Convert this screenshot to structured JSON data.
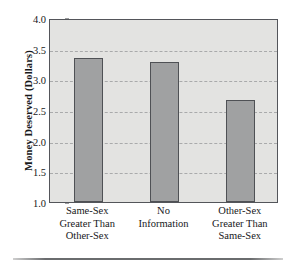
{
  "chart_data": {
    "type": "bar",
    "title": "",
    "xlabel": "",
    "ylabel": "Money Deserved (Dollars)",
    "categories": [
      "Same-Sex Greater Than Other-Sex",
      "No Information",
      "Other-Sex Greater Than Same-Sex"
    ],
    "category_lines": [
      [
        "Same-Sex",
        "Greater Than",
        "Other-Sex"
      ],
      [
        "No",
        "Information"
      ],
      [
        "Other-Sex",
        "Greater Than",
        "Same-Sex"
      ]
    ],
    "values": [
      3.35,
      3.28,
      2.66
    ],
    "ylim": [
      1.0,
      4.0
    ],
    "ytick_labels": [
      "4.0",
      "3.5",
      "3.0",
      "2.5",
      "2.0",
      "1.5",
      "1.0"
    ],
    "ytick_values": [
      4.0,
      3.5,
      3.0,
      2.5,
      2.0,
      1.5,
      1.0
    ],
    "gridlines": [
      3.5,
      3.0,
      2.5,
      2.0,
      1.5
    ],
    "grid": true,
    "legend": "none",
    "colors": {
      "bar_fill": "#a0a1a2",
      "bar_edge": "#4f5155",
      "plot_background": "#e3e3e1",
      "axis": "#53555a",
      "grid": "#a9aaab",
      "text": "#17181a"
    }
  }
}
